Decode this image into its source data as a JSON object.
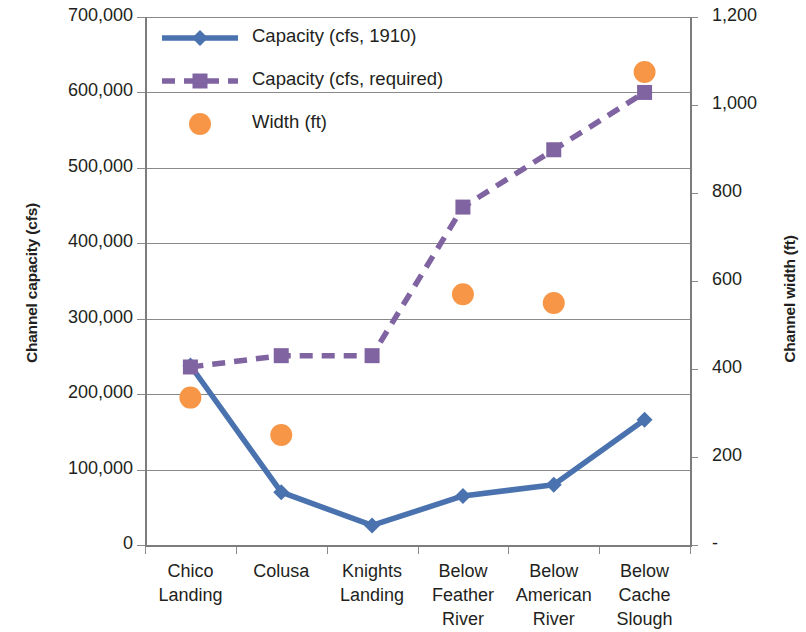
{
  "chart_data": {
    "type": "line",
    "title": "",
    "xlabel": "",
    "ylabel": "Channel capacity (cfs)",
    "y2label": "Channel width (ft)",
    "categories": [
      "Chico Landing",
      "Colusa",
      "Knights Landing",
      "Below Feather River",
      "Below American River",
      "Below Cache Slough"
    ],
    "category_lines": [
      [
        "Chico",
        "Landing"
      ],
      [
        "Colusa"
      ],
      [
        "Knights",
        "Landing"
      ],
      [
        "Below",
        "Feather",
        "River"
      ],
      [
        "Below",
        "American",
        "River"
      ],
      [
        "Below",
        "Cache",
        "Slough"
      ]
    ],
    "ylim": [
      0,
      700000
    ],
    "y2lim": [
      0,
      1200
    ],
    "yticks": [
      0,
      100000,
      200000,
      300000,
      400000,
      500000,
      600000,
      700000
    ],
    "ytick_labels": [
      "0",
      "100,000",
      "200,000",
      "300,000",
      "400,000",
      "500,000",
      "600,000",
      "700,000"
    ],
    "y2ticks": [
      0,
      200,
      400,
      600,
      800,
      1000,
      1200
    ],
    "y2tick_labels": [
      "-",
      "200",
      "400",
      "600",
      "800",
      "1,000",
      "1,200"
    ],
    "grid": true,
    "legend_position": "top-center-inside",
    "series": [
      {
        "name": "Capacity (cfs, 1910)",
        "axis": "left",
        "style": "solid",
        "marker": "diamond",
        "color": "#4A72AE",
        "values": [
          238000,
          70000,
          26000,
          65000,
          80000,
          166000
        ]
      },
      {
        "name": "Capacity (cfs, required)",
        "axis": "left",
        "style": "dashed",
        "marker": "square",
        "color": "#8064A2",
        "values": [
          236000,
          251000,
          251000,
          448000,
          524000,
          600000
        ]
      },
      {
        "name": "Width (ft)",
        "axis": "right",
        "style": "none",
        "marker": "circle",
        "color": "#F79646",
        "values": [
          335,
          250,
          null,
          570,
          550,
          1075
        ]
      }
    ]
  },
  "legend": {
    "items": [
      {
        "label": "Capacity (cfs, 1910)",
        "color": "#4A72AE",
        "marker": "diamond",
        "style": "solid"
      },
      {
        "label": "Capacity (cfs, required)",
        "color": "#8064A2",
        "marker": "square",
        "style": "dashed"
      },
      {
        "label": "Width (ft)",
        "color": "#F79646",
        "marker": "circle",
        "style": "none"
      }
    ]
  },
  "colors": {
    "series_blue": "#4A72AE",
    "series_purple": "#8064A2",
    "series_orange": "#F79646",
    "grid": "#8a8a8a",
    "axis": "#7c7c7c",
    "text": "#231f20"
  }
}
